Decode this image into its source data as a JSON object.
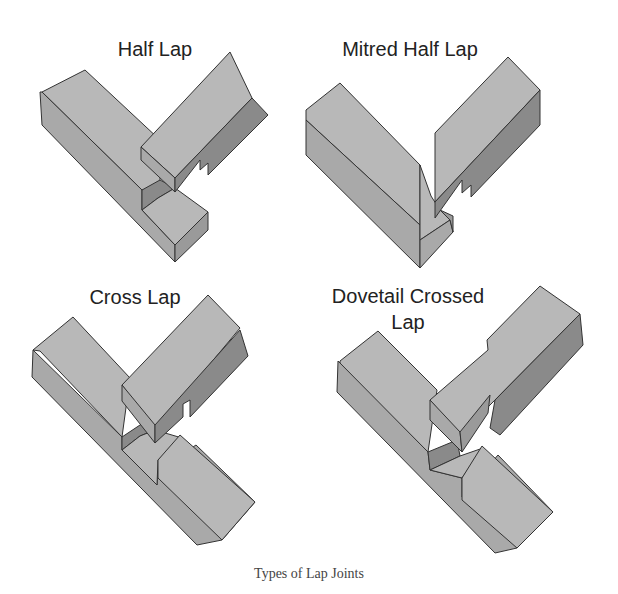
{
  "diagram": {
    "caption": "Types of Lap Joints",
    "joints": [
      {
        "label": "Half Lap"
      },
      {
        "label": "Mitred Half Lap"
      },
      {
        "label": "Cross Lap"
      },
      {
        "label": "Dovetail Crossed",
        "label_line2": "Lap"
      }
    ],
    "colors": {
      "face_light": "#b8b8b8",
      "face_mid": "#a9a9a9",
      "face_dark": "#8a8a8a",
      "outline": "#333333",
      "background": "#ffffff"
    }
  }
}
